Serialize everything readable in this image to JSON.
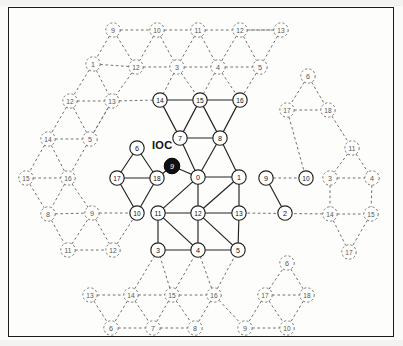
{
  "figure": {
    "type": "network-topology-diagram",
    "title_label": "IOC",
    "colors": {
      "frame": "#1b1b1b",
      "solid_edge": "#222222",
      "dashed_edge": "#6f6f6f",
      "node_fill": "#ffffff",
      "node_stroke": "#222222",
      "ioc_node_fill": "#111111",
      "ioc_node_text": "#ffffff",
      "background": "#fdfdfc"
    },
    "ioc_marker": {
      "label": "IOC",
      "node_id": "9",
      "x": 172,
      "y": 166,
      "text_x": 152,
      "text_y": 146
    },
    "nodes_solid": [
      {
        "id": "14",
        "x": 160,
        "y": 100
      },
      {
        "id": "15",
        "x": 200,
        "y": 100
      },
      {
        "id": "16",
        "x": 240,
        "y": 100
      },
      {
        "id": "7",
        "x": 180,
        "y": 138
      },
      {
        "id": "8",
        "x": 220,
        "y": 138
      },
      {
        "id": "0",
        "x": 198,
        "y": 177
      },
      {
        "id": "1",
        "x": 239,
        "y": 177
      },
      {
        "id": "11",
        "x": 158,
        "y": 213
      },
      {
        "id": "12",
        "x": 198,
        "y": 213
      },
      {
        "id": "13",
        "x": 239,
        "y": 213
      },
      {
        "id": "3",
        "x": 158,
        "y": 250
      },
      {
        "id": "4",
        "x": 198,
        "y": 250
      },
      {
        "id": "5",
        "x": 238,
        "y": 250
      },
      {
        "id": "6",
        "x": 137,
        "y": 148
      },
      {
        "id": "17",
        "x": 117,
        "y": 178
      },
      {
        "id": "18",
        "x": 157,
        "y": 178
      },
      {
        "id": "10",
        "x": 137,
        "y": 213
      },
      {
        "id": "9",
        "x": 266,
        "y": 178
      },
      {
        "id": "10r",
        "x": 306,
        "y": 178,
        "display": "10"
      },
      {
        "id": "2",
        "x": 285,
        "y": 213
      }
    ],
    "nodes_dashed": [
      {
        "id": "9",
        "x": 113,
        "y": 30
      },
      {
        "id": "10",
        "x": 157,
        "y": 30
      },
      {
        "id": "12",
        "x": 136,
        "y": 67
      },
      {
        "id": "11",
        "x": 198,
        "y": 30
      },
      {
        "id": "12b",
        "x": 240,
        "y": 30,
        "display": "12"
      },
      {
        "id": "13",
        "x": 281,
        "y": 30
      },
      {
        "id": "3",
        "x": 177,
        "y": 67
      },
      {
        "id": "4",
        "x": 218,
        "y": 67
      },
      {
        "id": "5",
        "x": 260,
        "y": 67
      },
      {
        "id": "1",
        "x": 93,
        "y": 64
      },
      {
        "id": "12c",
        "x": 70,
        "y": 101,
        "display": "12"
      },
      {
        "id": "13b",
        "x": 112,
        "y": 101,
        "display": "13"
      },
      {
        "id": "14",
        "x": 48,
        "y": 139
      },
      {
        "id": "5b",
        "x": 90,
        "y": 139,
        "display": "5"
      },
      {
        "id": "15",
        "x": 26,
        "y": 178
      },
      {
        "id": "16",
        "x": 68,
        "y": 178
      },
      {
        "id": "8",
        "x": 48,
        "y": 214
      },
      {
        "id": "11b",
        "x": 68,
        "y": 250,
        "display": "11"
      },
      {
        "id": "9b",
        "x": 92,
        "y": 213,
        "display": "9"
      },
      {
        "id": "12d",
        "x": 113,
        "y": 250,
        "display": "12"
      },
      {
        "id": "13c",
        "x": 90,
        "y": 295,
        "display": "13"
      },
      {
        "id": "14b",
        "x": 131,
        "y": 295,
        "display": "14"
      },
      {
        "id": "15b",
        "x": 172,
        "y": 295,
        "display": "15"
      },
      {
        "id": "16b",
        "x": 214,
        "y": 295,
        "display": "16"
      },
      {
        "id": "6b",
        "x": 111,
        "y": 328,
        "display": "6"
      },
      {
        "id": "7b",
        "x": 153,
        "y": 328,
        "display": "7"
      },
      {
        "id": "8b",
        "x": 195,
        "y": 328,
        "display": "8"
      },
      {
        "id": "17",
        "x": 265,
        "y": 295
      },
      {
        "id": "18",
        "x": 307,
        "y": 295
      },
      {
        "id": "6c",
        "x": 287,
        "y": 263,
        "display": "6"
      },
      {
        "id": "9c",
        "x": 245,
        "y": 328,
        "display": "9"
      },
      {
        "id": "10b",
        "x": 287,
        "y": 328,
        "display": "10"
      },
      {
        "id": "6d",
        "x": 308,
        "y": 76,
        "display": "6"
      },
      {
        "id": "17b",
        "x": 287,
        "y": 110,
        "display": "17"
      },
      {
        "id": "18b",
        "x": 328,
        "y": 110,
        "display": "18"
      },
      {
        "id": "11c",
        "x": 352,
        "y": 148,
        "display": "11"
      },
      {
        "id": "3b",
        "x": 330,
        "y": 178,
        "display": "3"
      },
      {
        "id": "4b",
        "x": 372,
        "y": 178,
        "display": "4"
      },
      {
        "id": "14c",
        "x": 330,
        "y": 214,
        "display": "14"
      },
      {
        "id": "15c",
        "x": 371,
        "y": 214,
        "display": "15"
      },
      {
        "id": "17c",
        "x": 349,
        "y": 252,
        "display": "17"
      }
    ],
    "edges_solid": [
      [
        "14",
        "15"
      ],
      [
        "15",
        "16"
      ],
      [
        "14",
        "7"
      ],
      [
        "15",
        "7"
      ],
      [
        "15",
        "8"
      ],
      [
        "16",
        "8"
      ],
      [
        "7",
        "8"
      ],
      [
        "7",
        "0"
      ],
      [
        "8",
        "0"
      ],
      [
        "8",
        "1"
      ],
      [
        "0",
        "1"
      ],
      [
        "0",
        "11"
      ],
      [
        "0",
        "12"
      ],
      [
        "1",
        "12"
      ],
      [
        "1",
        "13"
      ],
      [
        "11",
        "12"
      ],
      [
        "12",
        "13"
      ],
      [
        "11",
        "3"
      ],
      [
        "11",
        "4"
      ],
      [
        "12",
        "4"
      ],
      [
        "12",
        "5"
      ],
      [
        "13",
        "5"
      ],
      [
        "3",
        "4"
      ],
      [
        "4",
        "5"
      ],
      [
        "6",
        "17"
      ],
      [
        "6",
        "18"
      ],
      [
        "17",
        "18"
      ],
      [
        "17",
        "10"
      ],
      [
        "18",
        "10"
      ],
      [
        "18",
        "IOC"
      ],
      [
        "IOC",
        "0"
      ],
      [
        "9",
        "2"
      ]
    ],
    "edges_dashed_note": "peripheral wrap-around images drawn with dashed gray strokes"
  }
}
